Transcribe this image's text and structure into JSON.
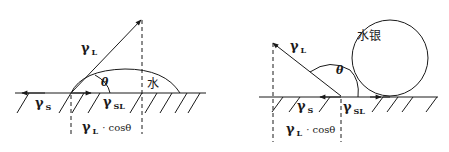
{
  "left_diagram": {
    "liquid_label": "水",
    "gamma_L": {
      "symbol": "γ",
      "sub": "L"
    },
    "gamma_S": {
      "symbol": "γ",
      "sub": "S"
    },
    "gamma_SL": {
      "symbol": "γ",
      "sub": "SL"
    },
    "theta": "θ",
    "projection": {
      "symbol": "γ",
      "sub": "L",
      "rest": "· cosθ"
    }
  },
  "right_diagram": {
    "liquid_label": "水银",
    "gamma_L": {
      "symbol": "γ",
      "sub": "L"
    },
    "gamma_S": {
      "symbol": "γ",
      "sub": "S"
    },
    "gamma_SL": {
      "symbol": "γ",
      "sub": "SL"
    },
    "theta": "θ",
    "projection": {
      "symbol": "γ",
      "sub": "L",
      "rest": "· cosθ"
    }
  }
}
